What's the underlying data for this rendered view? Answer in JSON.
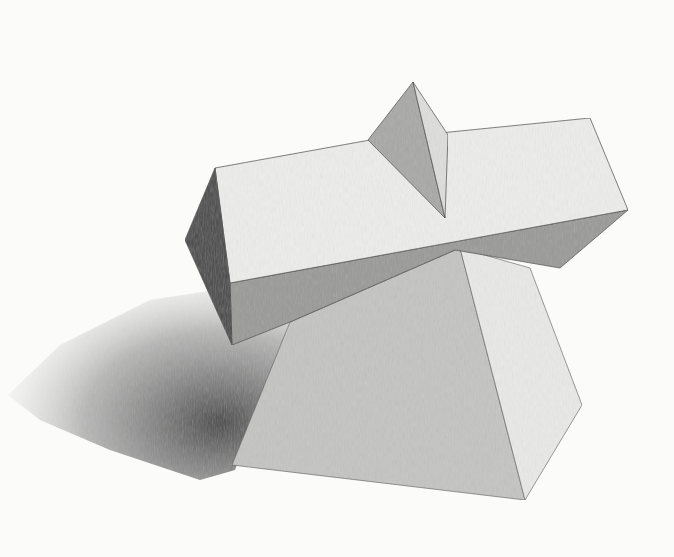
{
  "artwork": {
    "subject": "pencil still-life drawing of geometric solids",
    "background": "#fbfbfa",
    "shadow": {
      "points": "8,395 60,345 150,300 215,290 255,330 290,322 235,470 200,480 110,450 40,420",
      "color": "#6e6e6e"
    },
    "pyramid": {
      "faces": [
        {
          "name": "front-face",
          "points": "290,322 460,248 525,500 232,465",
          "color": "#c4c4c2"
        },
        {
          "name": "right-face",
          "points": "460,248 530,268 582,405 525,500",
          "color": "#e9e9e7"
        }
      ]
    },
    "bar": {
      "faces": [
        {
          "name": "top-face",
          "points": "215,168 370,140 590,118 628,210 230,283",
          "color": "#ededeb"
        },
        {
          "name": "end-face",
          "points": "215,168 230,283 232,345 185,240",
          "color": "#4a4a4a"
        },
        {
          "name": "front-face",
          "points": "230,283 628,210 560,268 455,250 290,322 232,345",
          "color": "#9a9a98"
        }
      ]
    },
    "wedge": {
      "faces": [
        {
          "name": "left-face",
          "points": "413,82 368,140 445,218",
          "color": "#a8a8a6"
        },
        {
          "name": "right-face",
          "points": "413,82 448,135 445,218",
          "color": "#dededc"
        }
      ]
    }
  }
}
